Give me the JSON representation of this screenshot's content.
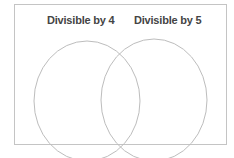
{
  "diagram": {
    "type": "venn",
    "sets": [
      {
        "label": "Divisible by 4",
        "cx": 87,
        "cy": 101,
        "rx": 53,
        "ry": 60
      },
      {
        "label": "Divisible by 5",
        "cx": 154,
        "cy": 100,
        "rx": 53,
        "ry": 61
      }
    ],
    "colors": {
      "circle_stroke": "#bdbdbd",
      "frame_border": "#c4c4c4",
      "label_text": "#444444"
    }
  }
}
